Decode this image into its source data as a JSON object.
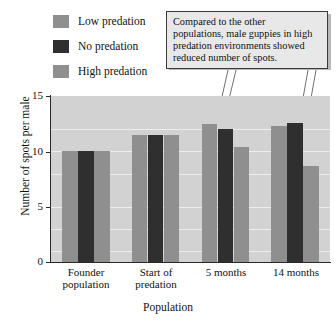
{
  "chart_data": {
    "type": "bar",
    "title": "",
    "xlabel": "Population",
    "ylabel": "Number of spots per male",
    "ylim": [
      0,
      15
    ],
    "yticks": [
      "0",
      "5",
      "10",
      "15"
    ],
    "grid": true,
    "legend_position": "top-left",
    "categories": [
      "Founder population",
      "Start of predation",
      "5 months",
      "14 months"
    ],
    "category_lines": [
      [
        "Founder",
        "population"
      ],
      [
        "Start of",
        "predation"
      ],
      [
        "5 months"
      ],
      [
        "14 months"
      ]
    ],
    "series": [
      {
        "name": "Low predation",
        "color": "#8f8f8f",
        "values": [
          10.0,
          11.5,
          12.5,
          12.3
        ]
      },
      {
        "name": "No predation",
        "color": "#2f2f2f",
        "values": [
          10.0,
          11.5,
          12.0,
          12.6
        ]
      },
      {
        "name": "High predation",
        "color": "#8f8f8f",
        "values": [
          10.0,
          11.5,
          10.4,
          8.7
        ]
      }
    ],
    "annotations": [
      {
        "text": "Compared to the other populations, male guppies in high predation environments showed reduced number of spots.",
        "lines": [
          "Compared to the other",
          "populations, male guppies in high",
          "predation environments showed",
          "reduced number of spots."
        ],
        "points_to": [
          "5 months / High predation",
          "14 months / High predation"
        ]
      }
    ]
  },
  "legend": {
    "items": [
      {
        "label": "Low predation",
        "color": "#8f8f8f"
      },
      {
        "label": "No predation",
        "color": "#2f2f2f"
      },
      {
        "label": "High predation",
        "color": "#8f8f8f"
      }
    ]
  },
  "colors": {
    "plot_background": "#d2d2d2",
    "gridline": "#ededed",
    "axis": "#2a2a2a",
    "callout_background": "#e8e8e8",
    "callout_border": "#3a3a3a"
  },
  "caption": {
    "text": ""
  }
}
